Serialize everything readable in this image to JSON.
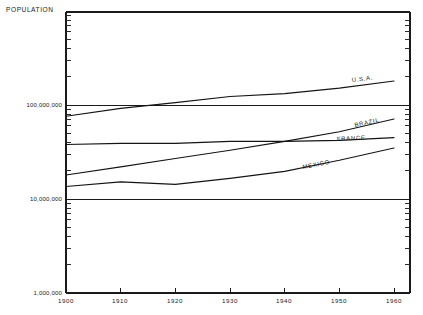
{
  "chart_data": {
    "type": "line",
    "title": "POPULATION",
    "xlabel": "",
    "ylabel": "POPULATION",
    "yscale": "log",
    "ylim": [
      1000000,
      1000000000
    ],
    "xlim": [
      1900,
      1960
    ],
    "grid": true,
    "legend_position": "inline-right",
    "x": [
      1900,
      1910,
      1920,
      1930,
      1940,
      1950,
      1960
    ],
    "xtick_labels": [
      "1900",
      "1910",
      "1920",
      "1930",
      "1940",
      "1950",
      "1960"
    ],
    "ytick_labels": [
      "1,000,000",
      "10,000,000",
      "100,000,000"
    ],
    "ytick_values": [
      1000000,
      10000000,
      100000000
    ],
    "series": [
      {
        "name": "U.S.A.",
        "label": "U.S.A.",
        "values": [
          76000000,
          92000000,
          106000000,
          123000000,
          132000000,
          151000000,
          180000000
        ]
      },
      {
        "name": "BRAZIL",
        "label": "BRAZIL",
        "values": [
          18000000,
          22000000,
          27000000,
          33000000,
          41000000,
          52000000,
          71000000
        ]
      },
      {
        "name": "FRANCE",
        "label": "FRANCE",
        "values": [
          38000000,
          39000000,
          39000000,
          41000000,
          41000000,
          42000000,
          45000000
        ]
      },
      {
        "name": "MEXICO",
        "label": "MEXICO",
        "values": [
          13600000,
          15200000,
          14300000,
          16600000,
          19700000,
          25800000,
          34900000
        ]
      }
    ]
  },
  "axes": {
    "title": "POPULATION",
    "y_labels": [
      {
        "text": "100,000,000"
      },
      {
        "text": "10,000,000"
      },
      {
        "text": "1,000,000"
      }
    ],
    "x_labels": [
      {
        "text": "1900"
      },
      {
        "text": "1910"
      },
      {
        "text": "1920"
      },
      {
        "text": "1930"
      },
      {
        "text": "1940"
      },
      {
        "text": "1950"
      },
      {
        "text": "1960"
      }
    ]
  },
  "series_labels": {
    "usa": "U.S.A.",
    "brazil": "BRAZIL",
    "france": "FRANCE",
    "mexico": "MEXICO"
  },
  "colors": {
    "ink": "#141414",
    "background": "#ffffff"
  }
}
